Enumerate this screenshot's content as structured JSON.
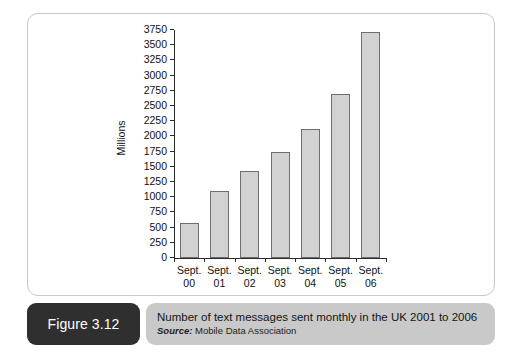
{
  "chart_data": {
    "type": "bar",
    "title": "",
    "xlabel": "",
    "ylabel": "Millions",
    "ylim": [
      0,
      3750
    ],
    "ytick_step": 250,
    "grid": false,
    "legend": "none",
    "categories": [
      "Sept. 00",
      "Sept. 01",
      "Sept. 02",
      "Sept. 03",
      "Sept. 04",
      "Sept. 05",
      "Sept. 06"
    ],
    "category_lines": [
      [
        "Sept.",
        "00"
      ],
      [
        "Sept.",
        "01"
      ],
      [
        "Sept.",
        "02"
      ],
      [
        "Sept.",
        "03"
      ],
      [
        "Sept.",
        "04"
      ],
      [
        "Sept.",
        "05"
      ],
      [
        "Sept.",
        "06"
      ]
    ],
    "values": [
      570,
      1100,
      1430,
      1740,
      2130,
      2690,
      3710
    ],
    "ytick_labels": [
      "0",
      "250",
      "500",
      "750",
      "1000",
      "1250",
      "1500",
      "1750",
      "2000",
      "2250",
      "2500",
      "2750",
      "3000",
      "3250",
      "3500",
      "3750"
    ],
    "bar_fill": "#d2d2d2",
    "bar_border": "#6e6e6e",
    "axis_color": "#2b2b2b"
  },
  "caption": {
    "figure_number": "Figure 3.12",
    "title": "Number of text messages sent monthly in the UK 2001 to 2006",
    "source_label": "Source:",
    "source_value": "Mobile Data Association",
    "badge_color": "#2f2f2f",
    "body_color": "#c9c9c9"
  }
}
